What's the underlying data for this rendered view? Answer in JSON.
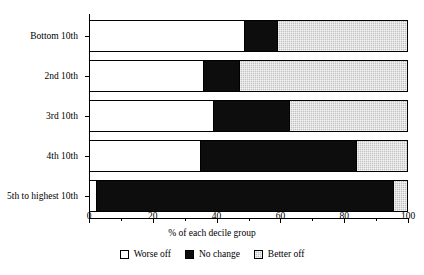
{
  "chart_data": {
    "type": "bar",
    "orientation": "horizontal",
    "stacked": true,
    "title": "",
    "xlabel": "% of each decile group",
    "ylabel": "",
    "xlim": [
      0,
      100
    ],
    "xticks": [
      0,
      20,
      40,
      60,
      80,
      100
    ],
    "xticklabels": [
      "0",
      "20",
      "40",
      "60",
      "80",
      "100"
    ],
    "minor_xticks": [
      10,
      30,
      50,
      70,
      90
    ],
    "grid": false,
    "legend_position": "bottom-center",
    "categories": [
      "Bottom 10th",
      "2nd 10th",
      "3rd 10th",
      "4th 10th",
      "5th to highest 10th"
    ],
    "series": [
      {
        "name": "Worse off",
        "color": "#ffffff",
        "values": [
          49,
          36,
          39,
          35,
          2
        ]
      },
      {
        "name": "No change",
        "color": "#0d0d0d",
        "values": [
          10,
          11,
          24,
          49,
          94
        ]
      },
      {
        "name": "Better off",
        "color": "#c2c2c2",
        "values": [
          41,
          53,
          37,
          16,
          4
        ]
      }
    ]
  },
  "legend": {
    "items": [
      {
        "label": "Worse off",
        "swatch": "white-swatch"
      },
      {
        "label": "No change",
        "swatch": "black-swatch"
      },
      {
        "label": "Better off",
        "swatch": "gray-swatch"
      }
    ]
  }
}
